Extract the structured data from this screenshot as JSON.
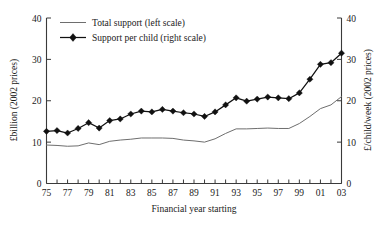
{
  "chart_data": {
    "type": "line",
    "title": "",
    "xlabel": "Financial year starting",
    "ylabel": "£billion (2002 prices)",
    "y2label": "£/child/week (2002 prices)",
    "grid": false,
    "legend_position": "top-left",
    "xlim": [
      1975,
      2003
    ],
    "ylim": [
      0,
      40
    ],
    "y2lim": [
      0,
      40
    ],
    "yticks": [
      0,
      10,
      20,
      30,
      40
    ],
    "y2ticks": [
      0,
      10,
      20,
      30,
      40
    ],
    "ytick_labels": [
      "0",
      "10",
      "20",
      "30",
      "40"
    ],
    "y2tick_labels": [
      "0",
      "10",
      "20",
      "30",
      "40"
    ],
    "x": [
      1975,
      1976,
      1977,
      1978,
      1979,
      1980,
      1981,
      1982,
      1983,
      1984,
      1985,
      1986,
      1987,
      1988,
      1989,
      1990,
      1991,
      1992,
      1993,
      1994,
      1995,
      1996,
      1997,
      1998,
      1999,
      2000,
      2001,
      2002,
      2003
    ],
    "xtick_labels": [
      "75",
      "",
      "77",
      "",
      "79",
      "",
      "81",
      "",
      "83",
      "",
      "85",
      "",
      "87",
      "",
      "89",
      "",
      "91",
      "",
      "93",
      "",
      "95",
      "",
      "97",
      "",
      "99",
      "",
      "01",
      "",
      "03"
    ],
    "xtick_labels_shown": [
      "75",
      "77",
      "79",
      "81",
      "83",
      "85",
      "87",
      "89",
      "91",
      "93",
      "95",
      "97",
      "99",
      "01",
      "03"
    ],
    "series": [
      {
        "name": "Total support (left scale)",
        "axis": "left",
        "style": "line",
        "color": "#6e6e6e",
        "values": [
          9.3,
          9.2,
          9.0,
          9.1,
          9.8,
          9.4,
          10.2,
          10.5,
          10.7,
          11.0,
          11.0,
          11.0,
          10.9,
          10.5,
          10.3,
          10.0,
          10.8,
          12.1,
          13.2,
          13.2,
          13.3,
          13.4,
          13.3,
          13.3,
          14.5,
          16.2,
          18.1,
          19.0,
          21.0
        ]
      },
      {
        "name": "Support per child (right scale)",
        "axis": "right",
        "style": "line-marker",
        "marker": "diamond",
        "color": "#111111",
        "values": [
          12.6,
          12.8,
          12.2,
          13.3,
          14.7,
          13.4,
          15.2,
          15.6,
          16.8,
          17.5,
          17.3,
          17.9,
          17.5,
          17.1,
          16.8,
          16.2,
          17.3,
          19.0,
          20.7,
          19.9,
          20.4,
          20.9,
          20.7,
          20.5,
          21.9,
          25.2,
          28.8,
          29.2,
          31.5
        ]
      }
    ]
  },
  "legend": {
    "items": [
      {
        "label": "Total support (left scale)"
      },
      {
        "label": "Support per child (right scale)"
      }
    ]
  }
}
